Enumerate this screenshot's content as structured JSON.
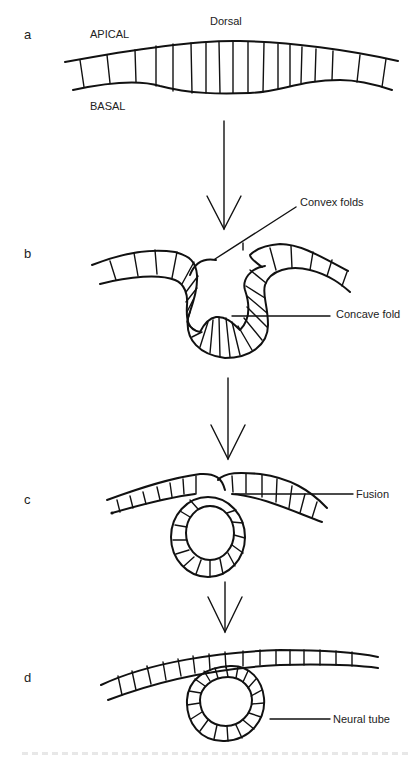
{
  "figure": {
    "panels": [
      {
        "letter": "a",
        "labels": {
          "top": "Dorsal",
          "apical": "APICAL",
          "basal": "BASAL"
        }
      },
      {
        "letter": "b",
        "labels": {
          "convex": "Convex folds",
          "concave": "Concave fold"
        }
      },
      {
        "letter": "c",
        "labels": {
          "fusion": "Fusion"
        }
      },
      {
        "letter": "d",
        "labels": {
          "tube": "Neural tube"
        }
      }
    ],
    "arrows": [
      {
        "from": "a",
        "to": "b"
      },
      {
        "from": "b",
        "to": "c"
      },
      {
        "from": "c",
        "to": "d"
      }
    ],
    "colors": {
      "ink": "#111111",
      "background": "#ffffff"
    }
  }
}
